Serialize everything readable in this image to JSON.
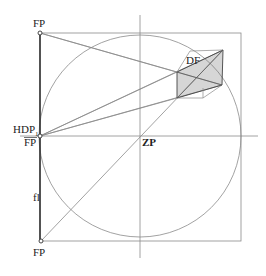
{
  "diagram": {
    "type": "perspective construction",
    "colors": {
      "line": "#8a8a8a",
      "strong": "#333333",
      "hatch": "#777777",
      "background": "#ffffff"
    },
    "labels": {
      "fp_top": "FP",
      "hdp": "HDP",
      "hdp_sub": "1",
      "fp_mid": "FP",
      "zp": "ZP",
      "fl": "fl",
      "fp_bottom": "FP",
      "df": "DF"
    },
    "geometry": {
      "square": {
        "x1": 40,
        "y1": 33,
        "x2": 241,
        "y2": 241
      },
      "center_zp": {
        "x": 140,
        "y": 136
      },
      "circle_radius": 101,
      "vertical_axis": {
        "x": 140,
        "y1": 15,
        "y2": 258
      },
      "horizontal_axis": {
        "y": 136,
        "x1": 20,
        "x2": 258
      },
      "points": {
        "fp_top": {
          "x": 40,
          "y": 33
        },
        "hdp1": {
          "x": 40,
          "y": 136
        },
        "fp_bottom": {
          "x": 41,
          "y": 241
        }
      },
      "object_df": {
        "front_top_left": {
          "x": 177,
          "y": 72
        },
        "front_top_right": {
          "x": 223,
          "y": 50
        },
        "front_bottom_right": {
          "x": 222,
          "y": 85
        },
        "front_bottom_left": {
          "x": 177,
          "y": 98
        },
        "back_top_left": {
          "x": 190,
          "y": 51
        },
        "back_bottom": {
          "x": 203,
          "y": 98
        }
      }
    }
  }
}
